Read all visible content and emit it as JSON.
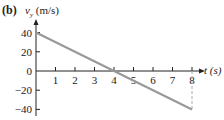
{
  "panel_label": "(b)",
  "y_axis": {
    "symbol": "v",
    "subscript": "y",
    "unit": " (m/s)"
  },
  "x_axis": {
    "label": "t (s)"
  },
  "colors": {
    "line": "#999999",
    "axis": "#222222",
    "dashed": "#aaaaaa"
  },
  "chart_data": {
    "type": "line",
    "xlabel": "t (s)",
    "ylabel": "v_y (m/s)",
    "x_ticks": [
      1,
      2,
      3,
      4,
      5,
      6,
      7,
      8
    ],
    "y_ticks": [
      40,
      20,
      0,
      -20,
      -40
    ],
    "xlim": [
      0,
      8
    ],
    "ylim": [
      -40,
      40
    ],
    "grid": false,
    "series": [
      {
        "name": "v_y",
        "x": [
          0,
          8
        ],
        "values": [
          40,
          -40
        ]
      }
    ],
    "annotations": [
      {
        "type": "dashed-vertical",
        "x": 8,
        "from": 0,
        "to": -40
      }
    ]
  }
}
